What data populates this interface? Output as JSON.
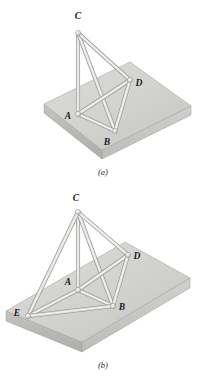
{
  "figure": {
    "panels": [
      {
        "id": "a",
        "caption": "(a)",
        "caption_pos": {
          "x": 103,
          "y": 175
        },
        "slab": {
          "name": "rectangular-slab",
          "top_face": [
            [
              44,
              104
            ],
            [
              130,
              62
            ],
            [
              191,
              106
            ],
            [
              102,
              150
            ]
          ],
          "thickness": 9,
          "color_top": "#d3d3d1",
          "color_front_left": "#b9b9b7",
          "color_front_right": "#c6c6c3"
        },
        "nodes": [
          {
            "id": "C",
            "x": 78,
            "y": 33,
            "label_x": 78,
            "label_y": 19,
            "support": false
          },
          {
            "id": "A",
            "x": 78,
            "y": 114,
            "label_x": 68,
            "label_y": 119,
            "support": true
          },
          {
            "id": "B",
            "x": 115,
            "y": 131,
            "label_x": 107,
            "label_y": 145,
            "support": true
          },
          {
            "id": "D",
            "x": 130,
            "y": 80,
            "label_x": 139,
            "label_y": 86,
            "support": true
          }
        ],
        "members": [
          [
            "C",
            "A"
          ],
          [
            "C",
            "B"
          ],
          [
            "C",
            "D"
          ],
          [
            "A",
            "B"
          ],
          [
            "A",
            "D"
          ],
          [
            "B",
            "D"
          ]
        ]
      },
      {
        "id": "b",
        "caption": "(b)",
        "caption_pos": {
          "x": 103,
          "y": 368
        },
        "slab": {
          "name": "rectangular-slab",
          "top_face": [
            [
              6,
              311
            ],
            [
              125,
              242
            ],
            [
              190,
              278
            ],
            [
              82,
              342
            ]
          ],
          "thickness": 10,
          "color_top": "#d3d3d1",
          "color_front_left": "#b9b9b7",
          "color_front_right": "#c6c6c3"
        },
        "nodes": [
          {
            "id": "C",
            "x": 78,
            "y": 212,
            "label_x": 76,
            "label_y": 201,
            "support": false
          },
          {
            "id": "A",
            "x": 78,
            "y": 290,
            "label_x": 68,
            "label_y": 285,
            "support": true
          },
          {
            "id": "B",
            "x": 113,
            "y": 306,
            "label_x": 122,
            "label_y": 310,
            "support": true
          },
          {
            "id": "D",
            "x": 128,
            "y": 255,
            "label_x": 137,
            "label_y": 259,
            "support": true
          },
          {
            "id": "E",
            "x": 28,
            "y": 316,
            "label_x": 17,
            "label_y": 316,
            "support": true
          }
        ],
        "members": [
          [
            "C",
            "A"
          ],
          [
            "C",
            "B"
          ],
          [
            "C",
            "D"
          ],
          [
            "C",
            "E"
          ],
          [
            "A",
            "B"
          ],
          [
            "A",
            "D"
          ],
          [
            "A",
            "E"
          ],
          [
            "B",
            "D"
          ],
          [
            "B",
            "E"
          ]
        ]
      }
    ],
    "colors": {
      "member_light": "#f2f2f0",
      "member_mid": "#cfcfcc",
      "member_dark": "#a8a8a5",
      "node_fill": "#e8e8e6",
      "node_stroke": "#9a9a97",
      "label_color": "#19191b",
      "background": "#ffffff"
    },
    "member_width": 3.0
  }
}
